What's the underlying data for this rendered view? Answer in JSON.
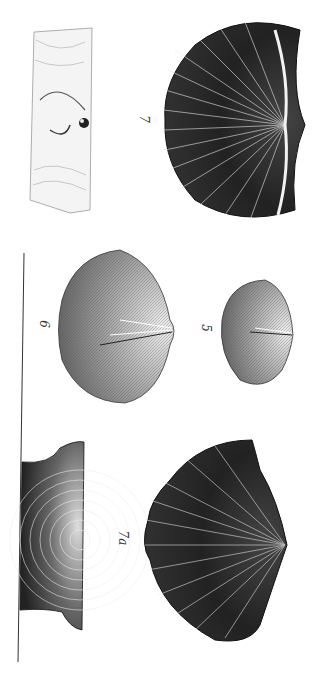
{
  "plate": {
    "description": "Lithographic plate of fossil brachiopod shells, rotated 90 degrees",
    "background_color": "#ffffff",
    "ink_color": "#1a1a1a"
  },
  "figures": [
    {
      "id": "fig-7-matrix",
      "label": "",
      "type": "shell impression in rock matrix"
    },
    {
      "id": "fig-7",
      "label": "7",
      "type": "ribbed shell, ventral view"
    },
    {
      "id": "fig-6",
      "label": "6",
      "type": "finely striated oval shell"
    },
    {
      "id": "fig-5",
      "label": "5",
      "type": "small finely striated shell"
    },
    {
      "id": "fig-7-section",
      "label": "",
      "type": "concentric-banded shell fragment"
    },
    {
      "id": "fig-7a",
      "label": "7a",
      "type": "ribbed shell, alternate view"
    }
  ],
  "divider": {
    "type": "vertical rule"
  }
}
